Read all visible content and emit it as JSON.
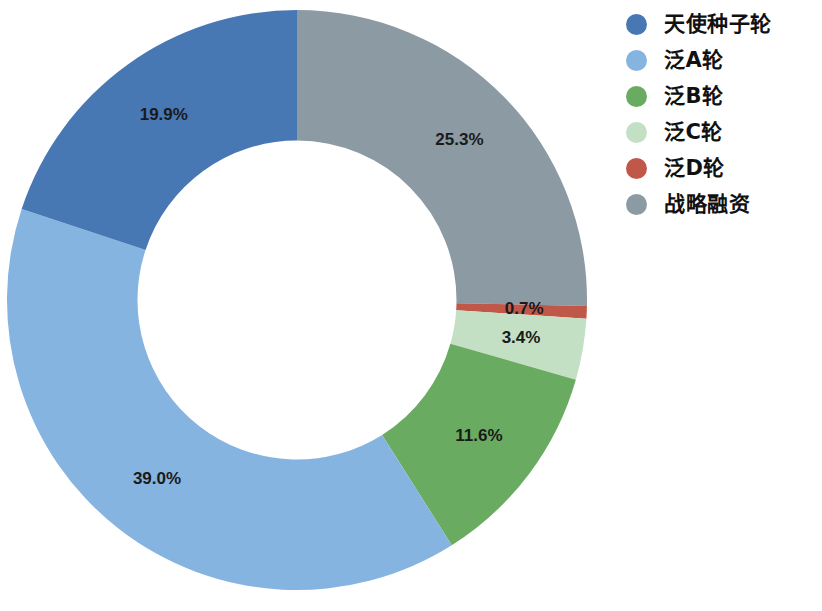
{
  "chart_data": {
    "type": "pie",
    "variant": "donut",
    "title": "",
    "subtitle": "",
    "xlabel": "",
    "ylabel": "",
    "legend_position": "right",
    "grid": false,
    "start_angle_deg": 0,
    "direction": "clockwise",
    "inner_radius_ratio": 0.55,
    "categories": [
      "天使种子轮",
      "泛A轮",
      "泛B轮",
      "泛C轮",
      "泛D轮",
      "战略融资"
    ],
    "values": [
      19.9,
      39.0,
      11.6,
      3.4,
      0.7,
      25.3
    ],
    "value_labels": [
      "19.9%",
      "39.0%",
      "11.6%",
      "3.4%",
      "0.7%",
      "25.3%"
    ],
    "colors": [
      "#4878b4",
      "#86b4e0",
      "#6aab62",
      "#c3e0c4",
      "#c0584a",
      "#8c9aa4"
    ],
    "unit": "%",
    "slices": [
      {
        "label": "战略融资",
        "value": 25.3,
        "value_label": "25.3%",
        "color": "#8c9aa4"
      },
      {
        "label": "泛D轮",
        "value": 0.7,
        "value_label": "0.7%",
        "color": "#c0584a"
      },
      {
        "label": "泛C轮",
        "value": 3.4,
        "value_label": "3.4%",
        "color": "#c3e0c4"
      },
      {
        "label": "泛B轮",
        "value": 11.6,
        "value_label": "11.6%",
        "color": "#6aab62"
      },
      {
        "label": "泛A轮",
        "value": 39.0,
        "value_label": "39.0%",
        "color": "#86b4e0"
      },
      {
        "label": "天使种子轮",
        "value": 19.9,
        "value_label": "19.9%",
        "color": "#4878b4"
      }
    ]
  },
  "legend": {
    "items": [
      {
        "label": "天使种子轮",
        "color": "#4878b4"
      },
      {
        "label": "泛A轮",
        "color": "#86b4e0"
      },
      {
        "label": "泛B轮",
        "color": "#6aab62"
      },
      {
        "label": "泛C轮",
        "color": "#c3e0c4"
      },
      {
        "label": "泛D轮",
        "color": "#c0584a"
      },
      {
        "label": "战略融资",
        "color": "#8c9aa4"
      }
    ]
  },
  "labels": {
    "angel_seed": "19.9%",
    "pan_a": "39.0%",
    "pan_b": "11.6%",
    "pan_c": "3.4%",
    "pan_d": "0.7%",
    "strategic": "25.3%"
  }
}
